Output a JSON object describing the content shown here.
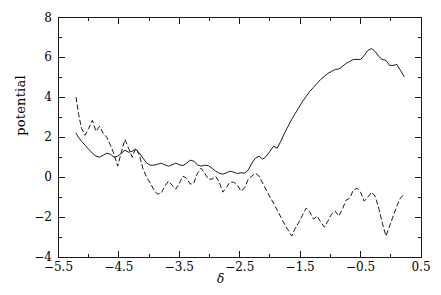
{
  "chart_data": {
    "type": "line",
    "title": "",
    "xlabel": "δ",
    "ylabel": "potential",
    "xlim": [
      -5.5,
      0.5
    ],
    "ylim": [
      -4,
      8
    ],
    "xticks": [
      -5.5,
      -4.5,
      -3.5,
      -2.5,
      -1.5,
      -0.5,
      0.5
    ],
    "xticklabels": [
      "-5.5",
      "-4.5",
      "-3.5",
      "-2.5",
      "-1.5",
      "-0.5",
      "0.5"
    ],
    "yticks": [
      -4,
      -2,
      0,
      2,
      4,
      6,
      8
    ],
    "yticklabels": [
      "-4",
      "-2",
      "0",
      "2",
      "4",
      "6",
      "8"
    ],
    "xminorticks": [
      -5.0,
      -4.0,
      -3.0,
      -2.0,
      -1.0,
      0.0
    ],
    "yminorticks": [
      -3,
      -1,
      1,
      3,
      5,
      7
    ],
    "grid": false,
    "legend": null,
    "frame": true,
    "series": [
      {
        "name": "solid",
        "style": "solid",
        "color": "#1a1a1a",
        "x": [
          -5.21,
          -5.17,
          -5.12,
          -5.06,
          -5.0,
          -4.94,
          -4.88,
          -4.82,
          -4.76,
          -4.7,
          -4.64,
          -4.58,
          -4.52,
          -4.46,
          -4.4,
          -4.34,
          -4.28,
          -4.22,
          -4.16,
          -4.1,
          -4.04,
          -3.98,
          -3.92,
          -3.86,
          -3.8,
          -3.74,
          -3.68,
          -3.62,
          -3.56,
          -3.5,
          -3.44,
          -3.38,
          -3.32,
          -3.26,
          -3.2,
          -3.14,
          -3.08,
          -3.02,
          -2.96,
          -2.9,
          -2.84,
          -2.78,
          -2.72,
          -2.66,
          -2.6,
          -2.54,
          -2.48,
          -2.42,
          -2.36,
          -2.3,
          -2.24,
          -2.18,
          -2.12,
          -2.06,
          -2.0,
          -1.94,
          -1.88,
          -1.82,
          -1.76,
          -1.7,
          -1.64,
          -1.58,
          -1.52,
          -1.46,
          -1.4,
          -1.34,
          -1.28,
          -1.22,
          -1.16,
          -1.1,
          -1.04,
          -0.98,
          -0.92,
          -0.86,
          -0.8,
          -0.74,
          -0.68,
          -0.62,
          -0.56,
          -0.5,
          -0.44,
          -0.38,
          -0.32,
          -0.26,
          -0.2,
          -0.14
        ],
        "y": [
          2.2,
          2.0,
          1.8,
          1.6,
          1.4,
          1.2,
          1.05,
          1.0,
          1.1,
          1.2,
          1.15,
          1.0,
          1.05,
          1.2,
          1.35,
          1.25,
          1.3,
          1.4,
          1.2,
          0.95,
          0.7,
          0.6,
          0.6,
          0.65,
          0.7,
          0.62,
          0.55,
          0.62,
          0.7,
          0.62,
          0.58,
          0.7,
          0.85,
          0.8,
          0.62,
          0.55,
          0.6,
          0.58,
          0.45,
          0.3,
          0.2,
          0.15,
          0.22,
          0.3,
          0.25,
          0.18,
          0.22,
          0.2,
          0.35,
          0.7,
          0.95,
          1.05,
          0.9,
          1.05,
          1.3,
          1.55,
          1.45,
          1.8,
          2.2,
          2.55,
          2.9,
          3.2,
          3.5,
          3.8,
          4.05,
          4.3,
          4.5,
          4.7,
          4.9,
          5.05,
          5.2,
          5.3,
          5.4,
          5.42,
          5.55,
          5.7,
          5.8,
          5.9,
          5.9,
          5.9,
          6.1,
          6.35,
          6.45,
          6.3,
          6.05,
          5.9
        ]
      },
      {
        "name": "solid-tail",
        "style": "solid",
        "color": "#1a1a1a",
        "x": [
          -0.14,
          -0.08,
          -0.02,
          0.04,
          0.1,
          0.16,
          0.22
        ],
        "y": [
          5.9,
          5.85,
          5.6,
          5.6,
          5.65,
          5.35,
          5.05
        ]
      },
      {
        "name": "dashed",
        "style": "dashed",
        "color": "#1a1a1a",
        "x": [
          -5.21,
          -5.17,
          -5.12,
          -5.06,
          -5.0,
          -4.94,
          -4.88,
          -4.82,
          -4.76,
          -4.7,
          -4.64,
          -4.58,
          -4.52,
          -4.46,
          -4.4,
          -4.34,
          -4.28,
          -4.22,
          -4.16,
          -4.1,
          -4.04,
          -3.98,
          -3.92,
          -3.86,
          -3.8,
          -3.74,
          -3.68,
          -3.62,
          -3.56,
          -3.5,
          -3.44,
          -3.38,
          -3.32,
          -3.26,
          -3.2,
          -3.14,
          -3.08,
          -3.02,
          -2.96,
          -2.9,
          -2.84,
          -2.78,
          -2.72,
          -2.66,
          -2.6,
          -2.54,
          -2.48,
          -2.42,
          -2.36,
          -2.3,
          -2.24,
          -2.18,
          -2.12,
          -2.06,
          -2.0,
          -1.94,
          -1.88,
          -1.82,
          -1.76,
          -1.7,
          -1.64,
          -1.58,
          -1.52,
          -1.46,
          -1.4,
          -1.34,
          -1.28,
          -1.22,
          -1.16,
          -1.1,
          -1.04,
          -0.98,
          -0.92,
          -0.86,
          -0.8,
          -0.74,
          -0.68,
          -0.62,
          -0.56,
          -0.5,
          -0.44,
          -0.38,
          -0.32,
          -0.26,
          -0.2,
          -0.14,
          -0.08,
          -0.02,
          0.04,
          0.1,
          0.16,
          0.22
        ],
        "y": [
          4.0,
          3.2,
          2.45,
          2.1,
          2.45,
          2.85,
          2.3,
          2.55,
          2.2,
          2.0,
          1.6,
          1.15,
          0.55,
          1.25,
          1.9,
          1.45,
          1.0,
          1.45,
          1.1,
          0.4,
          0.0,
          -0.3,
          -0.65,
          -0.85,
          -0.8,
          -0.45,
          -0.2,
          -0.4,
          -0.6,
          -0.3,
          0.05,
          -0.05,
          -0.35,
          -0.3,
          0.2,
          0.45,
          0.2,
          -0.1,
          -0.1,
          0.05,
          -0.25,
          -0.75,
          -0.5,
          -0.25,
          -0.25,
          -0.4,
          -0.7,
          -0.55,
          -0.1,
          0.05,
          0.2,
          0.05,
          -0.3,
          -0.65,
          -1.0,
          -1.3,
          -1.65,
          -2.0,
          -2.35,
          -2.65,
          -2.95,
          -2.55,
          -2.25,
          -1.9,
          -1.55,
          -1.75,
          -2.1,
          -1.95,
          -2.25,
          -2.5,
          -2.2,
          -1.85,
          -1.7,
          -1.95,
          -1.6,
          -1.15,
          -1.05,
          -0.65,
          -0.55,
          -0.75,
          -1.2,
          -1.0,
          -0.75,
          -0.95,
          -1.55,
          -2.3,
          -2.95,
          -2.45,
          -1.95,
          -1.45,
          -1.05,
          -0.85
        ]
      }
    ]
  }
}
